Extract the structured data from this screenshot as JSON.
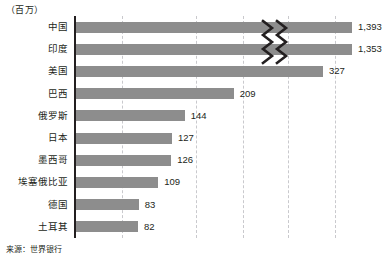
{
  "unit_label": "（百万）",
  "source_note": "来源：世界银行",
  "chart_data": {
    "type": "bar",
    "orientation": "horizontal",
    "title": "",
    "subtitle": "",
    "xlabel": "",
    "ylabel": "",
    "unit": "百万",
    "source": "来源：世界银行",
    "categories": [
      "中国",
      "印度",
      "美国",
      "巴西",
      "俄罗斯",
      "日本",
      "墨西哥",
      "埃塞俄比亚",
      "德国",
      "土耳其"
    ],
    "values": [
      1393,
      1353,
      327,
      209,
      144,
      127,
      126,
      109,
      83,
      82
    ],
    "value_labels": [
      "1,393",
      "1,353",
      "327",
      "209",
      "144",
      "127",
      "126",
      "109",
      "83",
      "82"
    ],
    "bar_color": "#8d8d8d",
    "axis_color": "#231f20",
    "grid": true,
    "gridline_style": "dashed",
    "gridline_color": "#c9c9cd",
    "gridline_x_px": [
      122,
      196,
      243,
      288,
      335
    ],
    "axis_break": true,
    "axis_break_note": "轴断裂标记（锯齿）位于前两条最长的条形上",
    "axis_break_rows": [
      0,
      1
    ],
    "legend": null,
    "xlim": [
      0,
      400
    ]
  }
}
